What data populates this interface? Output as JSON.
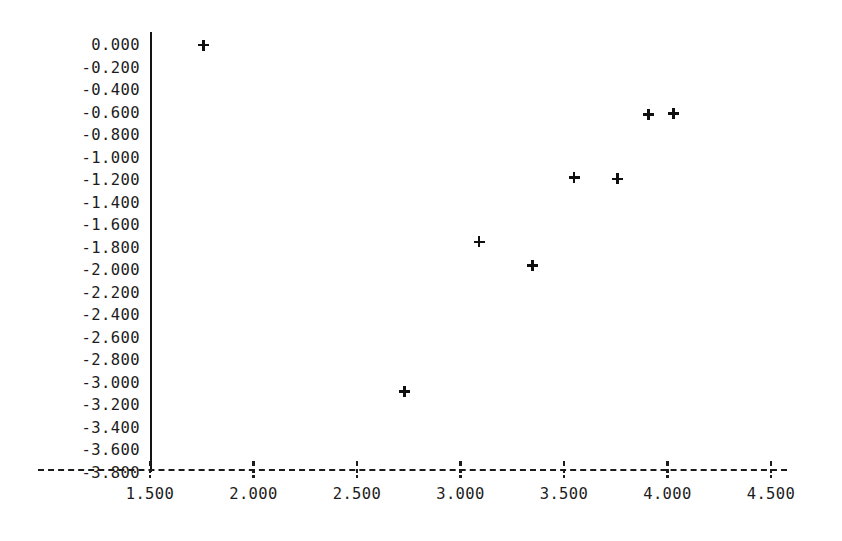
{
  "chart_data": {
    "type": "scatter",
    "title": "",
    "xlabel": "",
    "ylabel": "",
    "xlim": [
      1.5,
      4.5
    ],
    "ylim": [
      -3.8,
      0.0
    ],
    "grid": false,
    "legend": null,
    "marker": "plus",
    "marker_color": "#101010",
    "x_tick_labels": [
      "1.500",
      "2.000",
      "2.500",
      "3.000",
      "3.500",
      "4.000",
      "4.500"
    ],
    "x_ticks": [
      1.5,
      2.0,
      2.5,
      3.0,
      3.5,
      4.0,
      4.5
    ],
    "y_tick_labels": [
      "0.000",
      "-0.200",
      "-0.400",
      "-0.600",
      "-0.800",
      "-1.000",
      "-1.200",
      "-1.400",
      "-1.600",
      "-1.800",
      "-2.000",
      "-2.200",
      "-2.400",
      "-2.600",
      "-2.800",
      "-3.000",
      "-3.200",
      "-3.400",
      "-3.600",
      "-3.800"
    ],
    "y_ticks": [
      0.0,
      -0.2,
      -0.4,
      -0.6,
      -0.8,
      -1.0,
      -1.2,
      -1.4,
      -1.6,
      -1.8,
      -2.0,
      -2.2,
      -2.4,
      -2.6,
      -2.8,
      -3.0,
      -3.2,
      -3.4,
      -3.6,
      -3.8
    ],
    "points": [
      {
        "x": 1.76,
        "y": 0.0
      },
      {
        "x": 2.73,
        "y": -3.08
      },
      {
        "x": 3.09,
        "y": -1.75
      },
      {
        "x": 3.35,
        "y": -1.96
      },
      {
        "x": 3.55,
        "y": -1.18
      },
      {
        "x": 3.76,
        "y": -1.19
      },
      {
        "x": 3.91,
        "y": -0.62
      },
      {
        "x": 4.03,
        "y": -0.61
      }
    ]
  },
  "axes_geometry": {
    "x_pixel_at_1_5": 150,
    "x_pixels_per_unit": 207.0,
    "y_pixel_at_0": 45,
    "y_pixels_per_unit": 112.5
  }
}
